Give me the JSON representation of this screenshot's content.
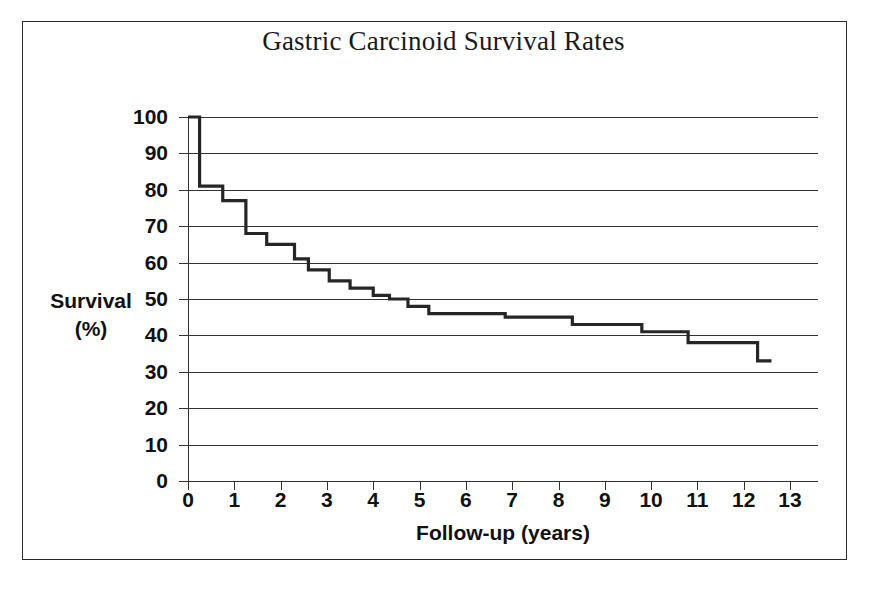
{
  "figure": {
    "title": "Gastric Carcinoid Survival Rates",
    "frame_color": "#2b2b2b",
    "background": "#ffffff",
    "curve_color": "#262626",
    "grid_color": "#333333"
  },
  "axes": {
    "y_title_line1": "Survival",
    "y_title_line2": "(%)",
    "x_title": "Follow-up (years)",
    "y_ticks": [
      "100",
      "90",
      "80",
      "70",
      "60",
      "50",
      "40",
      "30",
      "20",
      "10",
      "0"
    ],
    "x_ticks": [
      "0",
      "1",
      "2",
      "3",
      "4",
      "5",
      "6",
      "7",
      "8",
      "9",
      "10",
      "11",
      "12",
      "13"
    ]
  },
  "chart_data": {
    "type": "line",
    "subtype": "kaplan-meier-step",
    "title": "Gastric Carcinoid Survival Rates",
    "xlabel": "Follow-up (years)",
    "ylabel": "Survival (%)",
    "xlim": [
      0,
      13
    ],
    "ylim": [
      0,
      100
    ],
    "xticks": [
      0,
      1,
      2,
      3,
      4,
      5,
      6,
      7,
      8,
      9,
      10,
      11,
      12,
      13
    ],
    "yticks": [
      0,
      10,
      20,
      30,
      40,
      50,
      60,
      70,
      80,
      90,
      100
    ],
    "grid": "horizontal",
    "legend": "none",
    "series": [
      {
        "name": "Overall survival",
        "step": "post",
        "x": [
          0.0,
          0.25,
          0.75,
          1.25,
          1.7,
          2.3,
          2.6,
          3.05,
          3.5,
          4.0,
          4.35,
          4.75,
          5.2,
          6.85,
          8.3,
          9.8,
          10.8,
          12.3,
          12.6
        ],
        "y": [
          100,
          81,
          77,
          68,
          65,
          61,
          58,
          55,
          53,
          51,
          50,
          48,
          46,
          45,
          43,
          41,
          38,
          33,
          33
        ]
      }
    ],
    "annotations": []
  }
}
